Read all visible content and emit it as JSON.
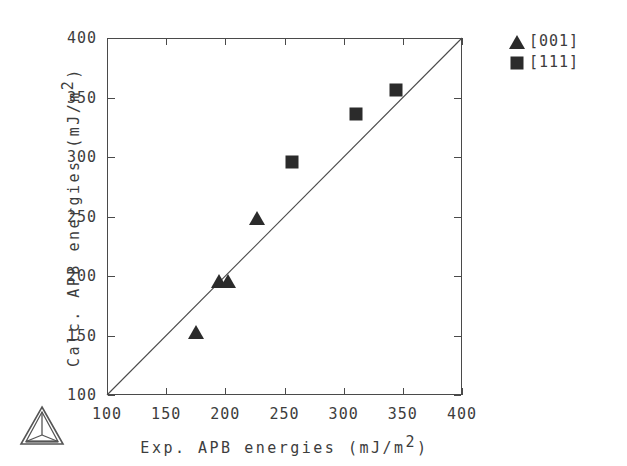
{
  "chart_data": {
    "type": "scatter",
    "title": "",
    "xlabel": "Exp. APB energies  (mJ/m2)",
    "ylabel": "Calc. APB energies  (mJ/m2)",
    "xlim": [
      100,
      400
    ],
    "ylim": [
      100,
      400
    ],
    "xticks": [
      100,
      150,
      200,
      250,
      300,
      350,
      400
    ],
    "yticks": [
      100,
      150,
      200,
      250,
      300,
      350,
      400
    ],
    "xticklabels": [
      "100",
      "150",
      "200",
      "250",
      "300",
      "350",
      "400"
    ],
    "yticklabels": [
      "100",
      "150",
      "200",
      "250",
      "300",
      "350",
      "400"
    ],
    "grid": false,
    "legend_position": "outside-top-right",
    "reference_line": {
      "label": "y = x",
      "from": [
        100,
        100
      ],
      "to": [
        400,
        400
      ]
    },
    "series": [
      {
        "name": "[001]",
        "marker": "triangle",
        "color": "#2b2b2b",
        "points": [
          {
            "x": 175,
            "y": 153
          },
          {
            "x": 195,
            "y": 196
          },
          {
            "x": 202,
            "y": 196
          },
          {
            "x": 227,
            "y": 249
          }
        ]
      },
      {
        "name": "[111]",
        "marker": "square",
        "color": "#2b2b2b",
        "points": [
          {
            "x": 256,
            "y": 296
          },
          {
            "x": 310,
            "y": 336
          },
          {
            "x": 344,
            "y": 356
          }
        ]
      }
    ]
  },
  "axes": {
    "x_title_main": "Exp. APB energies  (mJ/m",
    "x_title_sup": "2",
    "x_title_tail": ")",
    "y_title_main": "Calc. APB energies  (mJ/m",
    "y_title_sup": "2",
    "y_title_tail": ")"
  },
  "legend": {
    "entries": [
      {
        "label": "[001]",
        "marker": "triangle"
      },
      {
        "label": "[111]",
        "marker": "square"
      }
    ]
  },
  "logo": {
    "name": "triangular-pyramid-logo"
  }
}
